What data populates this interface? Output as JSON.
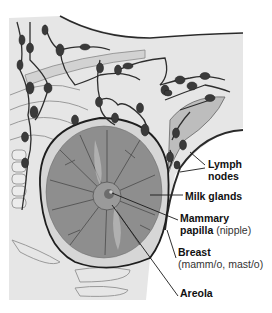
{
  "figure": {
    "labels": {
      "lymph_nodes": {
        "line1": "Lymph",
        "line2": "nodes"
      },
      "milk_glands": {
        "text": "Milk glands"
      },
      "mammary_papilla": {
        "line1": "Mammary",
        "line2_bold": "papilla",
        "line2_note": "(nipple)"
      },
      "breast": {
        "line1": "Breast",
        "line2": "(mamm/o, mast/o)"
      },
      "areola": {
        "text": "Areola"
      }
    },
    "colors": {
      "skin_fill": "#e4e4e4",
      "outline": "#222222",
      "gland_fill": "#8a8a8a",
      "lymph_node": "#3a3a3a",
      "rib": "#cfcfcf"
    }
  }
}
